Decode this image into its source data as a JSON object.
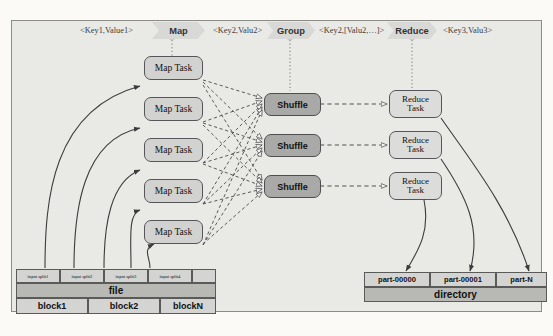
{
  "diagram": {
    "header": {
      "stages": [
        {
          "name": "key1-label",
          "text": "<Key1,Value1>",
          "type": "keylabel"
        },
        {
          "name": "map-stage",
          "text": "Map",
          "type": "chevron"
        },
        {
          "name": "key2-label",
          "text": "<Key2,Valu2>",
          "type": "keylabel"
        },
        {
          "name": "group-stage",
          "text": "Group",
          "type": "chevron"
        },
        {
          "name": "key2-list-label",
          "text": "<Key2,[Valu2,…]>",
          "type": "keylabel"
        },
        {
          "name": "reduce-stage",
          "text": "Reduce",
          "type": "chevron"
        },
        {
          "name": "key3-label",
          "text": "<Key3,Valu3>",
          "type": "keylabel"
        }
      ]
    },
    "map_tasks": [
      "Map Task",
      "Map Task",
      "Map Task",
      "Map Task",
      "Map Task"
    ],
    "shuffles": [
      "Shuffle",
      "Shuffle",
      "Shuffle"
    ],
    "reduce_tasks": [
      {
        "line1": "Reduce",
        "line2": "Task"
      },
      {
        "line1": "Reduce",
        "line2": "Task"
      },
      {
        "line1": "Reduce",
        "line2": "Task"
      }
    ],
    "input_file": {
      "splits": [
        "input split1",
        "input split2",
        "input split3",
        "input split4",
        ""
      ],
      "file_label": "file",
      "blocks": [
        "block1",
        "block2",
        "blockN"
      ]
    },
    "output_directory": {
      "parts": [
        "part-00000",
        "part-00001",
        "part-N"
      ],
      "directory_label": "directory"
    },
    "colors": {
      "panel_bg": "#e9e9e6",
      "map_task_fill": "#d2d2d0",
      "shuffle_fill": "#a9a9a7",
      "reduce_task_fill": "#dcdcda",
      "chevron_fill": "#d8d8d6",
      "stroke": "#4a4a4a"
    }
  }
}
